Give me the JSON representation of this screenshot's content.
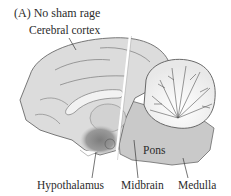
{
  "figure": {
    "panel_title": "(A)  No sham rage",
    "labels": {
      "cerebral_cortex": "Cerebral cortex",
      "pons": "Pons",
      "hypothalamus": "Hypothalamus",
      "midbrain": "Midbrain",
      "medulla": "Medulla"
    },
    "colors": {
      "brain_fill": "#d9d9d9",
      "brain_outline": "#6a6a6a",
      "hypothalamus_shade": "#8e8e8e",
      "cut_line": "#ffffff",
      "label_text": "#2b2b2b"
    }
  }
}
